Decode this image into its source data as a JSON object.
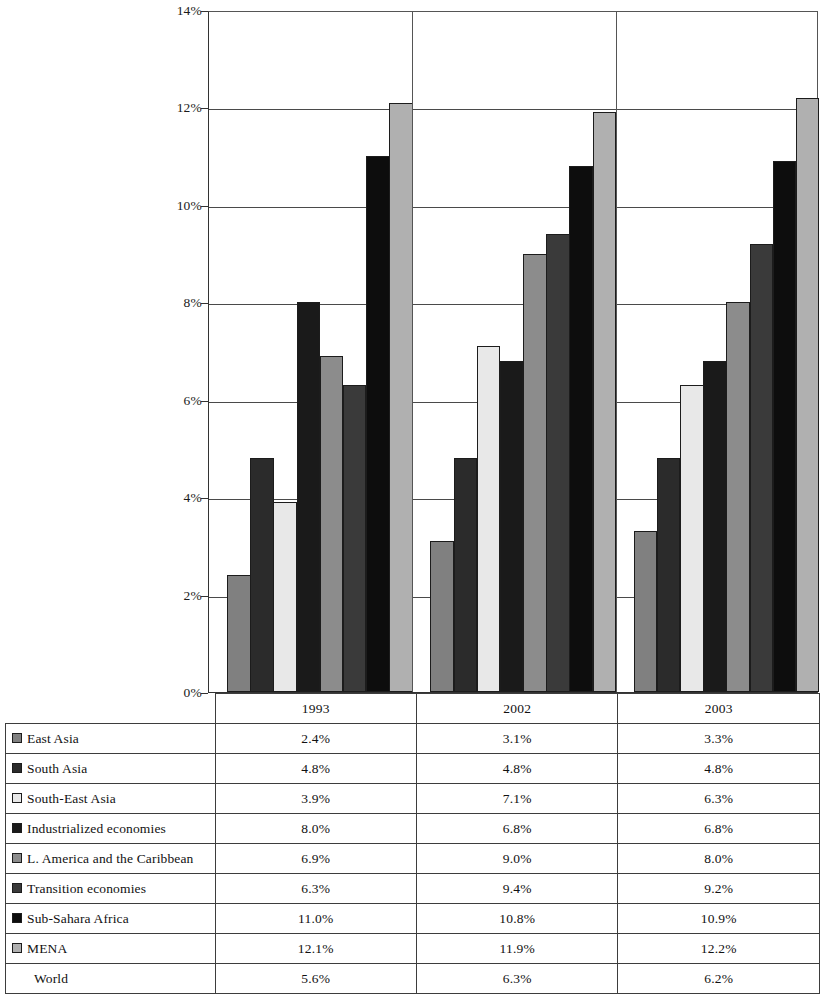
{
  "chart_data": {
    "type": "bar",
    "title": "",
    "xlabel": "",
    "ylabel": "",
    "categories": [
      "1993",
      "2002",
      "2003"
    ],
    "ylim": [
      0,
      14
    ],
    "ytick_labels": [
      "0%",
      "2%",
      "4%",
      "6%",
      "8%",
      "10%",
      "12%",
      "14%"
    ],
    "ytick_values": [
      0,
      2,
      4,
      6,
      8,
      10,
      12,
      14
    ],
    "grid": true,
    "legend_position": "table-below",
    "series": [
      {
        "name": "East Asia",
        "color": "#808080",
        "values": [
          2.4,
          3.1,
          3.3
        ],
        "labels": [
          "2.4%",
          "3.1%",
          "3.3%"
        ],
        "plotted": true
      },
      {
        "name": "South Asia",
        "color": "#2b2b2b",
        "values": [
          4.8,
          4.8,
          4.8
        ],
        "labels": [
          "4.8%",
          "4.8%",
          "4.8%"
        ],
        "plotted": true
      },
      {
        "name": "South-East Asia",
        "color": "#e8e8e8",
        "values": [
          3.9,
          7.1,
          6.3
        ],
        "labels": [
          "3.9%",
          "7.1%",
          "6.3%"
        ],
        "plotted": true
      },
      {
        "name": "Industrialized economies",
        "color": "#1a1a1a",
        "values": [
          8.0,
          6.8,
          6.8
        ],
        "labels": [
          "8.0%",
          "6.8%",
          "6.8%"
        ],
        "plotted": true
      },
      {
        "name": "L. America and the Caribbean",
        "color": "#8c8c8c",
        "values": [
          6.9,
          9.0,
          8.0
        ],
        "labels": [
          "6.9%",
          "9.0%",
          "8.0%"
        ],
        "plotted": true
      },
      {
        "name": "Transition economies",
        "color": "#3a3a3a",
        "values": [
          6.3,
          9.4,
          9.2
        ],
        "labels": [
          "6.3%",
          "9.4%",
          "9.2%"
        ],
        "plotted": true
      },
      {
        "name": "Sub-Sahara Africa",
        "color": "#0d0d0d",
        "values": [
          11.0,
          10.8,
          10.9
        ],
        "labels": [
          "11.0%",
          "10.8%",
          "10.9%"
        ],
        "plotted": true
      },
      {
        "name": "MENA",
        "color": "#b0b0b0",
        "values": [
          12.1,
          11.9,
          12.2
        ],
        "labels": [
          "12.1%",
          "11.9%",
          "12.2%"
        ],
        "plotted": true
      },
      {
        "name": "World",
        "color": null,
        "values": [
          5.6,
          6.3,
          6.2
        ],
        "labels": [
          "5.6%",
          "6.3%",
          "6.2%"
        ],
        "plotted": false
      }
    ]
  },
  "table": {
    "header": {
      "row_label": "",
      "years": [
        "1993",
        "2002",
        "2003"
      ]
    }
  }
}
